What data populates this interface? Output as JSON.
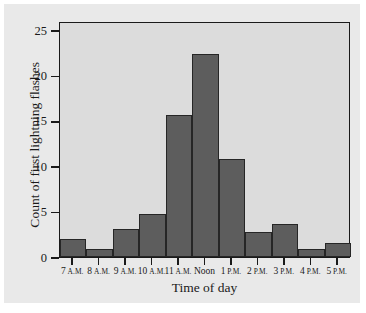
{
  "chart_data": {
    "type": "bar",
    "title": "",
    "xlabel": "Time of day",
    "ylabel": "Count of first lightning flashes",
    "categories": [
      "7 A.M.",
      "8 A.M.",
      "9 A.M.",
      "10 A.M.",
      "11 A.M.",
      "Noon",
      "1 P.M.",
      "2 P.M.",
      "3 P.M.",
      "4 P.M.",
      "5 P.M."
    ],
    "category_parts": [
      {
        "num": "7",
        "suffix": "A.M."
      },
      {
        "num": "8",
        "suffix": "A.M."
      },
      {
        "num": "9",
        "suffix": "A.M."
      },
      {
        "num": "10",
        "suffix": "A.M."
      },
      {
        "num": "11",
        "suffix": "A.M."
      },
      {
        "num": "Noon",
        "suffix": ""
      },
      {
        "num": "1",
        "suffix": "P.M."
      },
      {
        "num": "2",
        "suffix": "P.M."
      },
      {
        "num": "3",
        "suffix": "P.M."
      },
      {
        "num": "4",
        "suffix": "P.M."
      },
      {
        "num": "5",
        "suffix": "P.M."
      }
    ],
    "values": [
      2,
      0.9,
      3.1,
      4.7,
      15.7,
      22.4,
      10.8,
      2.8,
      3.6,
      0.9,
      1.5
    ],
    "ylim": [
      0,
      26
    ],
    "xlim": [
      0,
      11
    ],
    "yticks": [
      0,
      5,
      10,
      15,
      20,
      25
    ],
    "ytick_labels": [
      "0",
      "5",
      "10",
      "15",
      "20",
      "25"
    ],
    "grid": false,
    "legend": null,
    "bar_color": "#5d5d5d",
    "bar_edge_color": "#262626",
    "plot_background": "#dcdcdc",
    "figure_background": "#e9e9e9",
    "axis_color": "#1a1a1a"
  }
}
